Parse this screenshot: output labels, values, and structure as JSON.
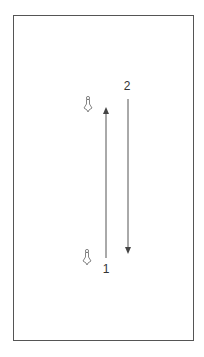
{
  "diagram": {
    "frame": {
      "left": 13,
      "top": 15,
      "width": 181,
      "height": 326,
      "stroke": "#555555"
    },
    "labels": [
      {
        "id": "label-2",
        "text": "2",
        "x": 127,
        "y": 86
      },
      {
        "id": "label-1",
        "text": "1",
        "x": 106,
        "y": 269
      }
    ],
    "markers": [
      {
        "id": "marker-top",
        "icon": "pin-icon",
        "x": 88,
        "y": 104
      },
      {
        "id": "marker-bottom",
        "icon": "pin-icon",
        "x": 87,
        "y": 257
      }
    ],
    "arrows": [
      {
        "id": "arrow-up",
        "direction": "up",
        "x": 106,
        "y_start": 258,
        "y_end": 107
      },
      {
        "id": "arrow-down",
        "direction": "down",
        "x": 128,
        "y_start": 99,
        "y_end": 254
      }
    ],
    "colors": {
      "line": "#555555",
      "icon": "#666666",
      "text": "#333333"
    }
  }
}
